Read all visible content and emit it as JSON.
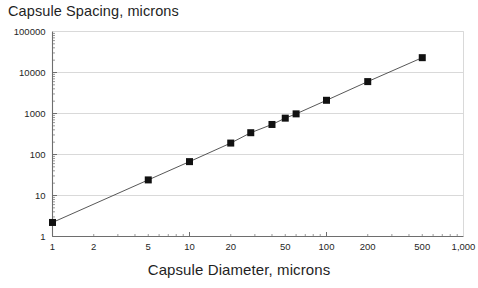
{
  "chart_data": {
    "type": "scatter",
    "title": "Capsule Spacing, microns",
    "xlabel": "Capsule Diameter, microns",
    "ylabel": "Capsule Spacing, microns",
    "xscale": "log",
    "yscale": "log",
    "xlim": [
      1,
      1000
    ],
    "ylim": [
      1,
      100000
    ],
    "grid": "horizontal",
    "legend": "none",
    "marker": "filled-square",
    "line": "solid-thin-black",
    "x_tick_labels": [
      "1",
      "2",
      "5",
      "10",
      "20",
      "50",
      "100",
      "200",
      "500",
      "1,000"
    ],
    "x_tick_values": [
      1,
      2,
      5,
      10,
      20,
      50,
      100,
      200,
      500,
      1000
    ],
    "y_tick_labels": [
      "1",
      "10",
      "100",
      "1000",
      "10000",
      "100000"
    ],
    "y_tick_values": [
      1,
      10,
      100,
      1000,
      10000,
      100000
    ],
    "x": [
      1,
      5,
      10,
      20,
      28,
      40,
      50,
      60,
      100,
      200,
      500
    ],
    "y": [
      2.2,
      24,
      67,
      190,
      340,
      540,
      770,
      980,
      2100,
      6000,
      23000
    ],
    "points": [
      {
        "x": 1,
        "y": 2.2
      },
      {
        "x": 5,
        "y": 24
      },
      {
        "x": 10,
        "y": 67
      },
      {
        "x": 20,
        "y": 190
      },
      {
        "x": 28,
        "y": 340
      },
      {
        "x": 40,
        "y": 540
      },
      {
        "x": 50,
        "y": 770
      },
      {
        "x": 60,
        "y": 980
      },
      {
        "x": 100,
        "y": 2100
      },
      {
        "x": 200,
        "y": 6000
      },
      {
        "x": 500,
        "y": 23000
      }
    ]
  },
  "colors": {
    "background": "#ffffff",
    "axis": "#6e6e6e",
    "grid": "#d9d9d9",
    "marker": "#111111",
    "line": "#444444",
    "text": "#1f1f1f"
  }
}
